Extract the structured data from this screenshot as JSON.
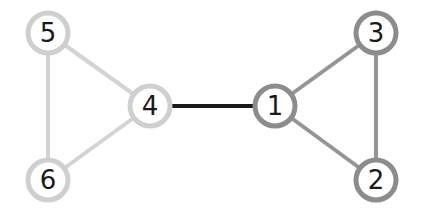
{
  "diagram": {
    "type": "graph",
    "nodes": [
      {
        "id": "1",
        "label": "1",
        "x": 275,
        "y": 106,
        "stroke": "#8c8c8c"
      },
      {
        "id": "2",
        "label": "2",
        "x": 376,
        "y": 180,
        "stroke": "#8c8c8c"
      },
      {
        "id": "3",
        "label": "3",
        "x": 376,
        "y": 33,
        "stroke": "#8c8c8c"
      },
      {
        "id": "4",
        "label": "4",
        "x": 150,
        "y": 106,
        "stroke": "#cfcfcf"
      },
      {
        "id": "5",
        "label": "5",
        "x": 48,
        "y": 33,
        "stroke": "#cfcfcf"
      },
      {
        "id": "6",
        "label": "6",
        "x": 48,
        "y": 180,
        "stroke": "#cfcfcf"
      }
    ],
    "edges": [
      {
        "from": "4",
        "to": "1",
        "color": "#1a1a1a"
      },
      {
        "from": "1",
        "to": "3",
        "color": "#959595"
      },
      {
        "from": "1",
        "to": "2",
        "color": "#959595"
      },
      {
        "from": "3",
        "to": "2",
        "color": "#959595"
      },
      {
        "from": "4",
        "to": "5",
        "color": "#d3d3d3"
      },
      {
        "from": "4",
        "to": "6",
        "color": "#d3d3d3"
      },
      {
        "from": "5",
        "to": "6",
        "color": "#d3d3d3"
      }
    ]
  }
}
